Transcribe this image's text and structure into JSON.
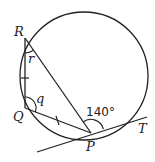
{
  "diagram": {
    "points": {
      "R": {
        "label": "R"
      },
      "Q": {
        "label": "Q"
      },
      "P": {
        "label": "P"
      },
      "T": {
        "label": "T"
      }
    },
    "angles": {
      "r": {
        "label": "r",
        "at": "R"
      },
      "q": {
        "label": "q",
        "at": "Q"
      },
      "tangent_angle": {
        "label": "140°",
        "at": "P"
      }
    },
    "equal_segments": [
      "RQ",
      "QP"
    ],
    "stroke_color": "#222222",
    "background": "#ffffff"
  }
}
